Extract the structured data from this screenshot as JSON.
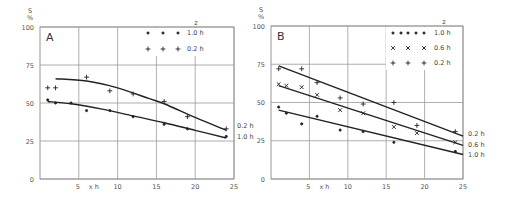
{
  "chart_data": [
    {
      "type": "scatter",
      "panel_label": "A",
      "title": "",
      "xlabel": "x h",
      "ylabel": "S %",
      "xlim": [
        0,
        25
      ],
      "ylim": [
        0,
        100
      ],
      "xticks": [
        "5",
        "10",
        "15",
        "20",
        "25"
      ],
      "yticks": [
        "0",
        "25",
        "50",
        "75",
        "100"
      ],
      "grid": true,
      "legend_title": "z",
      "legend_position": "upper right",
      "series": [
        {
          "name": "1.0 h",
          "marker": "dot",
          "x": [
            1,
            2,
            4,
            6,
            9,
            12,
            16,
            19,
            24
          ],
          "y": [
            52,
            50,
            50,
            45,
            45,
            41,
            36,
            33,
            28
          ],
          "fit_curve": [
            [
              1,
              51
            ],
            [
              4,
              49.5
            ],
            [
              8,
              46
            ],
            [
              12,
              41.5
            ],
            [
              16,
              37
            ],
            [
              20,
              32
            ],
            [
              24,
              27
            ]
          ],
          "end_label": "1.0 h"
        },
        {
          "name": "0.2 h",
          "marker": "plus",
          "x": [
            1,
            2,
            6,
            9,
            12,
            16,
            19,
            24
          ],
          "y": [
            60,
            60,
            67,
            58,
            56,
            51,
            41,
            33
          ],
          "fit_curve": [
            [
              2,
              66
            ],
            [
              6,
              64.5
            ],
            [
              10,
              60
            ],
            [
              14,
              53
            ],
            [
              16,
              49.5
            ],
            [
              20,
              40.5
            ],
            [
              24,
              32
            ]
          ],
          "end_label": "0.2 h"
        }
      ]
    },
    {
      "type": "scatter",
      "panel_label": "B",
      "title": "",
      "xlabel": "x h",
      "ylabel": "S %",
      "xlim": [
        0,
        25
      ],
      "ylim": [
        0,
        100
      ],
      "xticks": [
        "5",
        "10",
        "15",
        "20",
        "25"
      ],
      "yticks": [
        "0",
        "25",
        "50",
        "75",
        "100"
      ],
      "grid": true,
      "legend_title": "z",
      "legend_position": "upper right",
      "series": [
        {
          "name": "1.0 h",
          "marker": "dot",
          "x": [
            1,
            2,
            4,
            6,
            9,
            12,
            16,
            24
          ],
          "y": [
            47,
            43,
            36,
            41,
            32,
            31,
            24,
            18
          ],
          "fit_line": [
            [
              1,
              45
            ],
            [
              25,
              16
            ]
          ],
          "end_label": "1.0 h"
        },
        {
          "name": "0.6 h",
          "marker": "cross",
          "x": [
            1,
            2,
            4,
            6,
            9,
            12,
            16,
            19,
            24
          ],
          "y": [
            62,
            61,
            60,
            55,
            45,
            43,
            34,
            30,
            24
          ],
          "fit_line": [
            [
              1,
              61
            ],
            [
              25,
              22
            ]
          ],
          "end_label": "0.6 h"
        },
        {
          "name": "0.2 h",
          "marker": "plus",
          "x": [
            1,
            4,
            6,
            9,
            12,
            16,
            19,
            24
          ],
          "y": [
            72,
            72,
            63,
            53,
            49,
            50,
            35,
            31
          ],
          "fit_line": [
            [
              1,
              74
            ],
            [
              25,
              28
            ]
          ],
          "end_label": "0.2 h"
        }
      ]
    }
  ],
  "labels": {
    "ylabel_top": "S",
    "ylabel_unit": "%",
    "x_axis_note": "x h"
  }
}
